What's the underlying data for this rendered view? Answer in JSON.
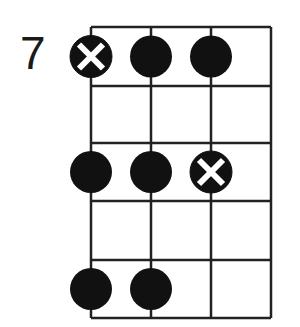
{
  "diagram": {
    "start_fret_label": "7",
    "strings": 4,
    "frets": 5,
    "colors": {
      "line": "#222222",
      "dot": "#111111",
      "root_cross": "#ffffff",
      "background": "#ffffff"
    },
    "grid": {
      "x": [
        91,
        151,
        211,
        271
      ],
      "y": [
        27,
        86,
        143,
        201,
        260,
        318
      ]
    },
    "notes": [
      {
        "string": 0,
        "row": 0,
        "type": "root"
      },
      {
        "string": 1,
        "row": 0,
        "type": "note"
      },
      {
        "string": 2,
        "row": 0,
        "type": "note"
      },
      {
        "string": 0,
        "row": 2,
        "type": "note"
      },
      {
        "string": 1,
        "row": 2,
        "type": "note"
      },
      {
        "string": 2,
        "row": 2,
        "type": "root"
      },
      {
        "string": 0,
        "row": 4,
        "type": "note"
      },
      {
        "string": 1,
        "row": 4,
        "type": "note"
      }
    ]
  }
}
